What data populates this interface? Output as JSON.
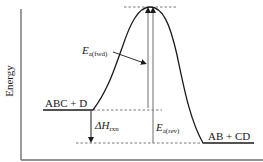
{
  "diagram": {
    "type": "energy-profile",
    "y_axis_label": "Energy",
    "reactants_label": "ABC + D",
    "products_label": "AB + CD",
    "ea_fwd": {
      "symbol": "E",
      "subscript": "a(fwd)"
    },
    "ea_rev": {
      "symbol": "E",
      "subscript": "a(rev)"
    },
    "delta_h": {
      "symbol": "ΔH",
      "subscript": "rxn"
    },
    "colors": {
      "curve": "#1a1a1a",
      "axis": "#6f6f6f",
      "arrow_fwd": "#7a7a7a",
      "arrow_rev": "#7a7a7a",
      "dashed": "#555555"
    }
  }
}
